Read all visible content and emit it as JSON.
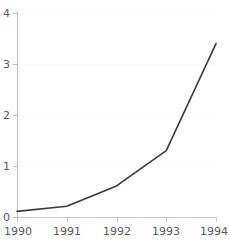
{
  "chart_data": {
    "type": "line",
    "title": "",
    "subtitle": "",
    "xlabel": "",
    "ylabel": "",
    "x": [
      1990,
      1991,
      1992,
      1993,
      1994
    ],
    "categories": [
      "1990",
      "1991",
      "1992",
      "1993",
      "1994"
    ],
    "values": [
      0.11,
      0.21,
      0.61,
      1.3,
      3.4
    ],
    "series": [
      {
        "name": "",
        "values": [
          0.11,
          0.21,
          0.61,
          1.3,
          3.4
        ]
      }
    ],
    "xlim": [
      1990,
      1994
    ],
    "ylim": [
      0,
      4
    ],
    "ytick_labels": [
      "0",
      "1",
      "2",
      "3",
      "4"
    ],
    "ytick_values": [
      0,
      1,
      2,
      3,
      4
    ],
    "xtick_labels": [
      "1990",
      "1991",
      "1992",
      "1993",
      "1994"
    ],
    "xtick_values": [
      1990,
      1991,
      1992,
      1993,
      1994
    ],
    "grid": "horizontal-faint",
    "legend": "none",
    "annotations": [],
    "colors": {
      "line": "#3b3b3b",
      "axis": "#bdbdbd",
      "gridline": "#fbfbfb",
      "tick_label": "#595959",
      "background": "#ffffff"
    }
  },
  "axes": {
    "y_labels": [
      "4",
      "3",
      "2",
      "1",
      "0"
    ],
    "x_labels": [
      "1990",
      "1991",
      "1992",
      "1993",
      "1994"
    ]
  }
}
